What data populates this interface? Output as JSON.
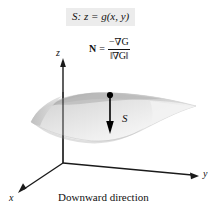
{
  "figure": {
    "type": "math-diagram",
    "background_color": "#ffffff",
    "caption": "Downward direction",
    "surface_equation": {
      "prefix": "S:",
      "body": "z = g(x, y)",
      "full": "S: z = g(x, y)",
      "background_color": "#ececec"
    },
    "normal_vector_formula": {
      "symbol": "N",
      "equals": "=",
      "numerator": "−∇G",
      "denominator": "‖∇G‖",
      "full": "N = −∇G / ‖∇G‖"
    },
    "surface_label": "S",
    "axes": [
      {
        "name": "z",
        "label": "z"
      },
      {
        "name": "y",
        "label": "y"
      },
      {
        "name": "x",
        "label": "x"
      }
    ],
    "colors": {
      "axis": "#1a1a1a",
      "surface_light": "#e4e4e4",
      "surface_mid": "#d2d2d2",
      "surface_dark": "#b6b6b6",
      "arrow": "#000000",
      "text": "#111111",
      "banner": "#ececec"
    }
  }
}
